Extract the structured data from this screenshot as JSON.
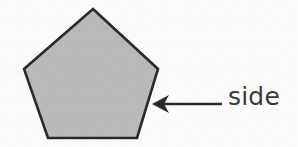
{
  "figure": {
    "background_color": "#fbfbfa",
    "width": 298,
    "height": 147
  },
  "shape": {
    "name": "pentagon",
    "sides": 5,
    "fill_color": "#b9b9b9",
    "stroke_color": "#2a2a2a",
    "stroke_width": 2.6,
    "vertices": [
      {
        "x": 93,
        "y": 9
      },
      {
        "x": 158,
        "y": 69
      },
      {
        "x": 137,
        "y": 138
      },
      {
        "x": 48,
        "y": 138
      },
      {
        "x": 24,
        "y": 69
      }
    ]
  },
  "annotation": {
    "label": "side",
    "label_color": "#3a3a3a",
    "label_font_size": 25,
    "arrow": {
      "name": "leftward-arrow",
      "color": "#2a2a2a",
      "tip": {
        "x": 152,
        "y": 104
      },
      "tail": {
        "x": 222,
        "y": 104
      },
      "shaft_width": 2.6,
      "head_length": 17,
      "head_half_width": 9
    }
  }
}
